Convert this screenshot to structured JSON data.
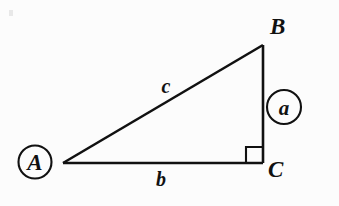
{
  "figure": {
    "kind": "right-triangle-diagram",
    "background_color": "#fcfcfc",
    "ink_color": "#111111",
    "stroke_width": 2.4,
    "canvas": {
      "width": 339,
      "height": 206
    },
    "vertices": {
      "A": {
        "label": "A",
        "x": 63,
        "y": 163,
        "circled": true
      },
      "B": {
        "label": "B",
        "x": 263,
        "y": 45,
        "circled": false
      },
      "C": {
        "label": "C",
        "x": 263,
        "y": 163,
        "circled": false
      }
    },
    "vertex_label_positions": {
      "A": {
        "x": 35,
        "y": 170
      },
      "B": {
        "x": 270,
        "y": 34
      },
      "C": {
        "x": 268,
        "y": 177
      }
    },
    "sides": {
      "a": {
        "label": "a",
        "from": "B",
        "to": "C",
        "circled": true,
        "label_x": 284,
        "label_y": 115
      },
      "b": {
        "label": "b",
        "from": "A",
        "to": "C",
        "circled": false,
        "label_x": 161,
        "label_y": 186
      },
      "c": {
        "label": "c",
        "from": "A",
        "to": "B",
        "circled": false,
        "label_x": 166,
        "label_y": 93
      }
    },
    "annotations": {
      "right_angle": {
        "at_vertex": "C",
        "size": 16,
        "description": "right-angle-square"
      },
      "circles": [
        {
          "name": "A",
          "cx": 35,
          "cy": 162,
          "r": 16.5
        },
        {
          "name": "a",
          "cx": 284,
          "cy": 107,
          "r": 17
        }
      ]
    }
  }
}
